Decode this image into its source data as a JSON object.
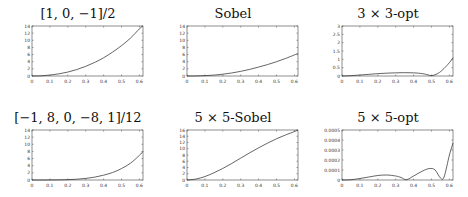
{
  "chart_data": [
    {
      "type": "line",
      "title": "[1, 0, −1]/2",
      "xlabel": "",
      "ylabel": "",
      "xlim": [
        0,
        0.62
      ],
      "ylim": [
        0,
        14
      ],
      "xticks": [
        "0",
        "0.1",
        "0.2",
        "0.3",
        "0.4",
        "0.5",
        "0.6"
      ],
      "yticks": [
        "0",
        "2",
        "4",
        "6",
        "8",
        "10",
        "12",
        "14"
      ],
      "x": [
        0,
        0.05,
        0.1,
        0.15,
        0.2,
        0.25,
        0.3,
        0.35,
        0.4,
        0.45,
        0.5,
        0.55,
        0.6,
        0.62
      ],
      "values": [
        0,
        0.05,
        0.25,
        0.6,
        1.1,
        1.8,
        2.7,
        3.8,
        5.1,
        6.7,
        8.5,
        10.6,
        13.2,
        14
      ]
    },
    {
      "type": "line",
      "title": "Sobel",
      "xlabel": "",
      "ylabel": "",
      "xlim": [
        0,
        0.62
      ],
      "ylim": [
        0,
        14
      ],
      "xticks": [
        "0",
        "0.1",
        "0.2",
        "0.3",
        "0.4",
        "0.5",
        "0.6"
      ],
      "yticks": [
        "0",
        "2",
        "4",
        "6",
        "8",
        "10",
        "12",
        "14"
      ],
      "x": [
        0,
        0.05,
        0.1,
        0.15,
        0.2,
        0.25,
        0.3,
        0.35,
        0.4,
        0.45,
        0.5,
        0.55,
        0.6,
        0.62
      ],
      "values": [
        0,
        0.02,
        0.1,
        0.25,
        0.5,
        0.85,
        1.3,
        1.85,
        2.5,
        3.2,
        4.0,
        4.9,
        5.9,
        6.3
      ]
    },
    {
      "type": "line",
      "title": "3 × 3-opt",
      "xlabel": "",
      "ylabel": "",
      "xlim": [
        0,
        0.62
      ],
      "ylim": [
        0,
        3
      ],
      "xticks": [
        "0",
        "0.1",
        "0.2",
        "0.3",
        "0.4",
        "0.5",
        "0.6"
      ],
      "yticks": [
        "0",
        "0.5",
        "1",
        "1.5",
        "2",
        "2.5",
        "3"
      ],
      "x": [
        0,
        0.05,
        0.1,
        0.15,
        0.2,
        0.25,
        0.3,
        0.35,
        0.4,
        0.45,
        0.48,
        0.5,
        0.53,
        0.56,
        0.6,
        0.62
      ],
      "values": [
        0,
        0.02,
        0.06,
        0.1,
        0.14,
        0.17,
        0.19,
        0.2,
        0.19,
        0.14,
        0.07,
        0.02,
        0.12,
        0.35,
        0.8,
        1.1
      ]
    },
    {
      "type": "line",
      "title": "[−1, 8, 0, −8, 1]/12",
      "xlabel": "",
      "ylabel": "",
      "xlim": [
        0,
        0.62
      ],
      "ylim": [
        0,
        14
      ],
      "xticks": [
        "0",
        "0.1",
        "0.2",
        "0.3",
        "0.4",
        "0.5",
        "0.6"
      ],
      "yticks": [
        "0",
        "2",
        "4",
        "6",
        "8",
        "10",
        "12",
        "14"
      ],
      "x": [
        0,
        0.05,
        0.1,
        0.15,
        0.2,
        0.25,
        0.3,
        0.35,
        0.4,
        0.45,
        0.5,
        0.55,
        0.6,
        0.62
      ],
      "values": [
        0,
        0,
        0.01,
        0.04,
        0.1,
        0.22,
        0.45,
        0.8,
        1.35,
        2.1,
        3.2,
        4.7,
        6.9,
        8.0
      ]
    },
    {
      "type": "line",
      "title": "5 × 5-Sobel",
      "xlabel": "",
      "ylabel": "",
      "xlim": [
        0,
        0.62
      ],
      "ylim": [
        0,
        16
      ],
      "xticks": [
        "0",
        "0.1",
        "0.2",
        "0.3",
        "0.4",
        "0.5",
        "0.6"
      ],
      "yticks": [
        "0",
        "2",
        "4",
        "6",
        "8",
        "10",
        "12",
        "14",
        "16"
      ],
      "x": [
        0,
        0.05,
        0.1,
        0.15,
        0.2,
        0.25,
        0.3,
        0.35,
        0.4,
        0.45,
        0.5,
        0.55,
        0.6,
        0.62
      ],
      "values": [
        0,
        0.3,
        1.1,
        2.3,
        3.7,
        5.3,
        7.0,
        8.7,
        10.3,
        11.8,
        13.2,
        14.4,
        15.5,
        16.0
      ]
    },
    {
      "type": "line",
      "title": "5 × 5-opt",
      "xlabel": "",
      "ylabel": "",
      "xlim": [
        0,
        0.62
      ],
      "ylim": [
        0,
        0.0005
      ],
      "xticks": [
        "0",
        "0.1",
        "0.2",
        "0.3",
        "0.4",
        "0.5",
        "0.6"
      ],
      "yticks": [
        "0",
        "0.0001",
        "0.0002",
        "0.0003",
        "0.0004",
        "0.0005"
      ],
      "x": [
        0,
        0.05,
        0.1,
        0.15,
        0.2,
        0.25,
        0.3,
        0.33,
        0.36,
        0.4,
        0.45,
        0.49,
        0.52,
        0.55,
        0.57,
        0.6,
        0.62
      ],
      "values": [
        0,
        3e-06,
        1.5e-05,
        3e-05,
        4.5e-05,
        5e-05,
        4e-05,
        2.5e-05,
        3e-06,
        4e-05,
        9e-05,
        0.000115,
        0.0001,
        2e-05,
        3e-05,
        0.00025,
        0.00037
      ]
    }
  ]
}
